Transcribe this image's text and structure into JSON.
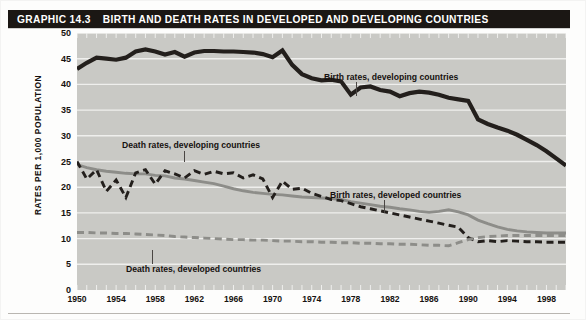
{
  "header": {
    "graphic_label": "GRAPHIC 14.3",
    "title": "BIRTH AND DEATH RATES IN DEVELOPED AND DEVELOPING COUNTRIES"
  },
  "colors": {
    "plot_background": "#c9c9c5",
    "gridline": "#efefed",
    "dark_series": "#231f1c",
    "gray_series": "#8d8d89",
    "title_bar": "#1b1714",
    "title_text": "#ffffff"
  },
  "annotations": [
    {
      "name": "birth-developing",
      "text": "Birth rates, developing countries"
    },
    {
      "name": "death-developing",
      "text": "Death rates, developing countries"
    },
    {
      "name": "birth-developed",
      "text": "Birth rates, developed countries"
    },
    {
      "name": "death-developed",
      "text": "Death rates, developed countries"
    }
  ],
  "chart_data": {
    "type": "line",
    "title": "BIRTH AND DEATH RATES IN DEVELOPED AND DEVELOPING COUNTRIES",
    "xlabel": "",
    "ylabel": "RATES PER 1,000 POPULATION",
    "xlim": [
      1950,
      2000
    ],
    "ylim": [
      0,
      50
    ],
    "ytick_step": 5,
    "yticks": [
      0,
      5,
      10,
      15,
      20,
      25,
      30,
      35,
      40,
      45,
      50
    ],
    "xticks": [
      1950,
      1954,
      1958,
      1962,
      1966,
      1970,
      1974,
      1978,
      1982,
      1986,
      1990,
      1994,
      1998
    ],
    "grid": "horizontal",
    "legend_position": "inline-annotations",
    "x": [
      1950,
      1951,
      1952,
      1953,
      1954,
      1955,
      1956,
      1957,
      1958,
      1959,
      1960,
      1961,
      1962,
      1963,
      1964,
      1965,
      1966,
      1967,
      1968,
      1969,
      1970,
      1971,
      1972,
      1973,
      1974,
      1975,
      1976,
      1977,
      1978,
      1979,
      1980,
      1981,
      1982,
      1983,
      1984,
      1985,
      1986,
      1987,
      1988,
      1989,
      1990,
      1991,
      1992,
      1993,
      1994,
      1995,
      1996,
      1997,
      1998,
      1999,
      2000
    ],
    "series": [
      {
        "name": "Birth rates, developing countries",
        "style": "solid",
        "color": "#231f1c",
        "width": "thick",
        "values": [
          43.0,
          44.2,
          45.2,
          45.0,
          44.8,
          45.2,
          46.4,
          46.8,
          46.4,
          45.8,
          46.3,
          45.4,
          46.2,
          46.5,
          46.5,
          46.4,
          46.4,
          46.3,
          46.2,
          45.9,
          45.3,
          46.6,
          43.8,
          42.0,
          41.2,
          40.8,
          40.9,
          40.6,
          38.0,
          39.4,
          39.6,
          38.9,
          38.6,
          37.7,
          38.3,
          38.6,
          38.4,
          38.0,
          37.4,
          37.1,
          36.8,
          33.2,
          32.3,
          31.6,
          31.0,
          30.2,
          29.2,
          28.2,
          27.0,
          25.6,
          24.2
        ]
      },
      {
        "name": "Birth rates, developed countries",
        "style": "solid",
        "color": "#8d8d89",
        "width": "medium",
        "values": [
          24.4,
          23.8,
          23.4,
          23.1,
          22.9,
          22.7,
          22.6,
          22.6,
          22.3,
          22.2,
          21.8,
          21.6,
          21.3,
          21.0,
          20.7,
          20.2,
          19.7,
          19.3,
          19.0,
          18.8,
          18.6,
          18.5,
          18.3,
          18.1,
          18.0,
          17.9,
          17.8,
          17.6,
          17.2,
          16.9,
          16.6,
          16.3,
          16.1,
          15.8,
          15.6,
          15.3,
          15.1,
          15.3,
          15.6,
          15.2,
          14.6,
          13.6,
          12.9,
          12.3,
          11.8,
          11.5,
          11.3,
          11.2,
          11.1,
          11.1,
          11.1
        ]
      },
      {
        "name": "Death rates, developing countries",
        "style": "dashed",
        "color": "#231f1c",
        "width": "medium",
        "values": [
          25.0,
          21.6,
          23.4,
          19.2,
          21.4,
          18.0,
          22.8,
          23.4,
          20.6,
          23.2,
          22.6,
          21.8,
          23.2,
          22.5,
          23.1,
          22.6,
          22.8,
          21.8,
          22.4,
          21.6,
          18.0,
          21.2,
          19.6,
          19.8,
          18.8,
          18.2,
          17.6,
          17.4,
          16.8,
          16.2,
          15.8,
          15.4,
          15.0,
          14.6,
          14.2,
          13.8,
          13.4,
          13.0,
          12.6,
          12.2,
          10.2,
          9.4,
          9.6,
          9.4,
          9.6,
          9.5,
          9.4,
          9.4,
          9.3,
          9.3,
          9.3
        ]
      },
      {
        "name": "Death rates, developed countries",
        "style": "dashed",
        "color": "#8d8d89",
        "width": "medium",
        "values": [
          11.2,
          11.2,
          11.1,
          11.1,
          11.0,
          11.0,
          10.9,
          10.8,
          10.7,
          10.6,
          10.4,
          10.3,
          10.2,
          10.1,
          10.0,
          9.9,
          9.8,
          9.8,
          9.7,
          9.7,
          9.6,
          9.5,
          9.5,
          9.4,
          9.4,
          9.3,
          9.3,
          9.2,
          9.2,
          9.1,
          9.1,
          9.0,
          9.0,
          8.9,
          8.9,
          8.8,
          8.7,
          8.7,
          8.6,
          9.2,
          9.8,
          10.2,
          10.4,
          10.5,
          10.6,
          10.6,
          10.6,
          10.6,
          10.6,
          10.6,
          10.6
        ]
      }
    ]
  }
}
